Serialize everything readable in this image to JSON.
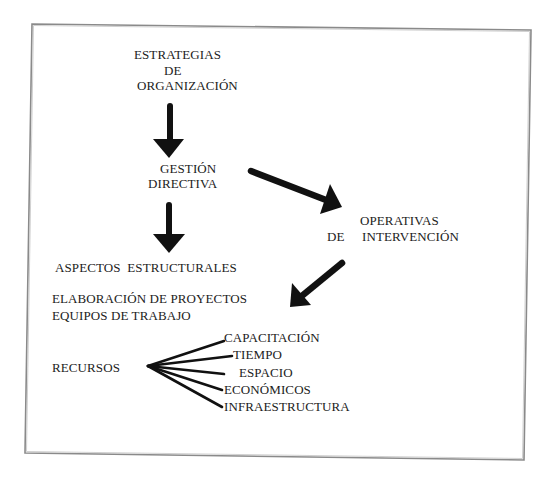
{
  "diagram": {
    "nodes": {
      "estrategias": {
        "line1": "ESTRATEGIAS",
        "line2": "DE",
        "line3": "ORGANIZACIÓN"
      },
      "gestion": {
        "line1": "GESTIÓN",
        "line2": "DIRECTIVA"
      },
      "operativas": {
        "line1": "OPERATIVAS",
        "line2_a": "DE",
        "line2_b": "INTERVENCIÓN"
      },
      "aspectos": "ASPECTOS  ESTRUCTURALES",
      "elaboracion": "ELABORACIÓN DE PROYECTOS",
      "equipos": "EQUIPOS DE TRABAJO",
      "recursos": "RECURSOS"
    },
    "recursos_items": [
      "CAPACITACIÓN",
      "TIEMPO",
      "ESPACIO",
      "ECONÓMICOS",
      "INFRAESTRUCTURA"
    ],
    "edges": [
      {
        "from": "ESTRATEGIAS DE ORGANIZACIÓN",
        "to": "GESTIÓN DIRECTIVA",
        "style": "thick-arrow"
      },
      {
        "from": "GESTIÓN DIRECTIVA",
        "to": "ASPECTOS ESTRUCTURALES",
        "style": "thick-arrow"
      },
      {
        "from": "GESTIÓN DIRECTIVA",
        "to": "OPERATIVAS DE INTERVENCIÓN",
        "style": "thick-arrow"
      },
      {
        "from": "OPERATIVAS DE INTERVENCIÓN",
        "to": "ELABORACIÓN DE PROYECTOS",
        "style": "thick-arrow"
      },
      {
        "from": "RECURSOS",
        "to": "CAPACITACIÓN",
        "style": "line"
      },
      {
        "from": "RECURSOS",
        "to": "TIEMPO",
        "style": "line"
      },
      {
        "from": "RECURSOS",
        "to": "ESPACIO",
        "style": "line"
      },
      {
        "from": "RECURSOS",
        "to": "ECONÓMICOS",
        "style": "line"
      },
      {
        "from": "RECURSOS",
        "to": "INFRAESTRUCTURA",
        "style": "line"
      }
    ],
    "colors": {
      "ink": "#111111",
      "text": "#1c1c1c",
      "border": "#8a8a8a",
      "background": "#ffffff"
    }
  }
}
